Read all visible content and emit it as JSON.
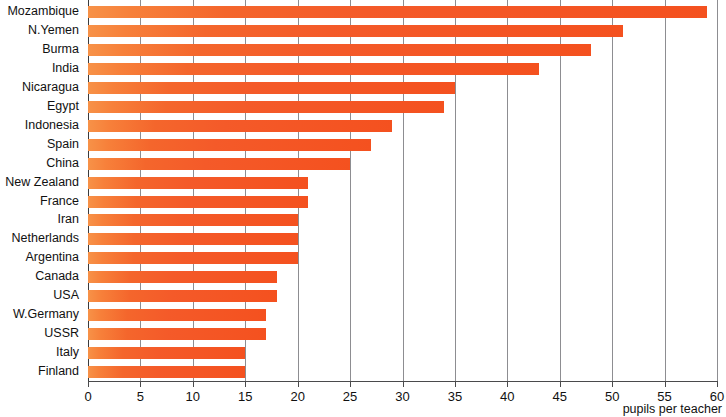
{
  "chart_data": {
    "type": "bar",
    "orientation": "horizontal",
    "title": "",
    "xlabel": "pupils per teacher",
    "ylabel": "",
    "xlim": [
      0,
      60
    ],
    "xticks": [
      0,
      5,
      10,
      15,
      20,
      25,
      30,
      35,
      40,
      45,
      50,
      55,
      60
    ],
    "grid": true,
    "legend": null,
    "categories": [
      "Mozambique",
      "N.Yemen",
      "Burma",
      "India",
      "Nicaragua",
      "Egypt",
      "Indonesia",
      "Spain",
      "China",
      "New Zealand",
      "France",
      "Iran",
      "Netherlands",
      "Argentina",
      "Canada",
      "USA",
      "W.Germany",
      "USSR",
      "Italy",
      "Finland"
    ],
    "values": [
      59,
      51,
      48,
      43,
      35,
      34,
      29,
      27,
      25,
      21,
      21,
      20,
      20,
      20,
      18,
      18,
      17,
      17,
      15,
      15
    ],
    "colors": {
      "bar_left": "#f79248",
      "bar_right": "#f4511f",
      "gridline": "#8d8d91",
      "axis": "#3a3a3c",
      "text": "#111111",
      "background": "#ffffff"
    }
  }
}
